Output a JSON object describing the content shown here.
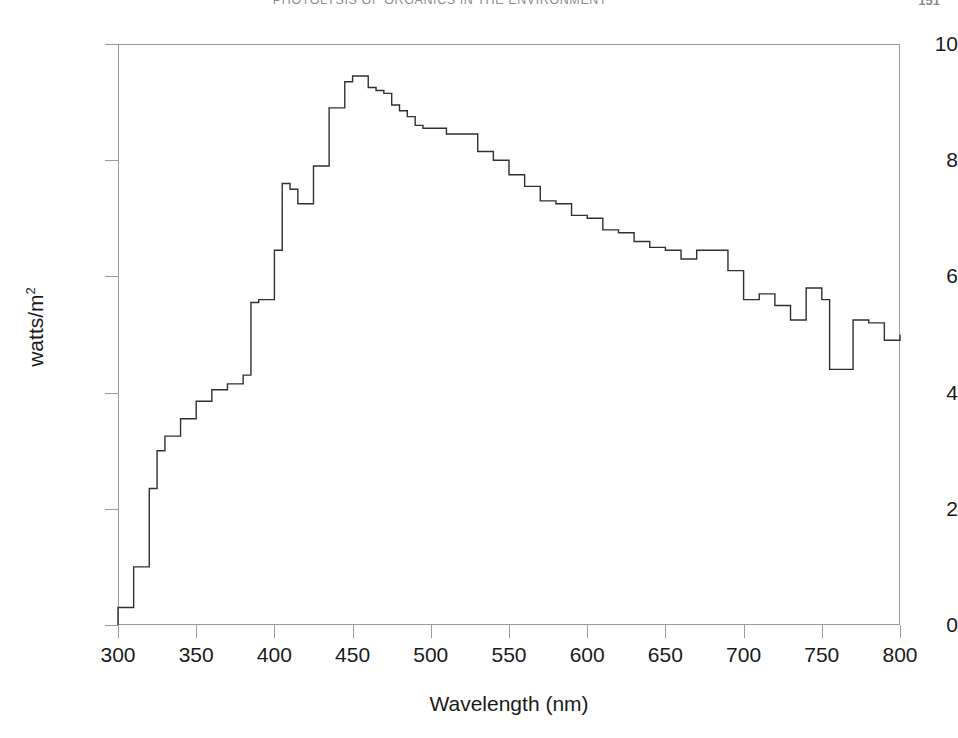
{
  "page": {
    "running_head": "PHOTOLYSIS OF ORGANICS IN THE ENVIRONMENT",
    "folio": "151"
  },
  "chart_data": {
    "type": "area",
    "render_style": "step",
    "title": "",
    "subtitle": "",
    "xlabel": "Wavelength (nm)",
    "ylabel": "watts/m2",
    "ylabel_base": "watts/m",
    "ylabel_exponent": "2",
    "xlim": [
      300,
      800
    ],
    "ylim": [
      0,
      10
    ],
    "xticks": [
      300,
      350,
      400,
      450,
      500,
      550,
      600,
      650,
      700,
      750,
      800
    ],
    "yticks": [
      0,
      2,
      4,
      6,
      8,
      10
    ],
    "xtick_labels": [
      "300",
      "350",
      "400",
      "450",
      "500",
      "550",
      "600",
      "650",
      "700",
      "750",
      "800"
    ],
    "ytick_labels": [
      "0",
      "2",
      "4",
      "6",
      "8",
      "10"
    ],
    "grid": false,
    "legend": "none",
    "line_color": "#303030",
    "line_width": 1.4,
    "bin_width_nm": 10,
    "x": [
      300,
      310,
      320,
      325,
      330,
      340,
      350,
      360,
      370,
      380,
      385,
      390,
      400,
      405,
      410,
      415,
      420,
      425,
      430,
      435,
      440,
      445,
      450,
      455,
      460,
      465,
      470,
      475,
      480,
      485,
      490,
      495,
      500,
      510,
      520,
      530,
      540,
      550,
      560,
      570,
      580,
      590,
      600,
      610,
      620,
      630,
      640,
      650,
      660,
      670,
      680,
      690,
      700,
      710,
      720,
      730,
      740,
      750,
      755,
      765,
      770,
      780,
      790,
      800
    ],
    "values": [
      0.3,
      1.0,
      2.35,
      3.0,
      3.25,
      3.55,
      3.85,
      4.05,
      4.15,
      4.3,
      5.55,
      5.6,
      6.45,
      7.6,
      7.5,
      7.25,
      7.25,
      7.9,
      7.9,
      8.9,
      8.9,
      9.35,
      9.45,
      9.45,
      9.25,
      9.2,
      9.15,
      8.95,
      8.85,
      8.75,
      8.6,
      8.55,
      8.55,
      8.45,
      8.45,
      8.15,
      8.0,
      7.75,
      7.55,
      7.3,
      7.25,
      7.05,
      7.0,
      6.8,
      6.75,
      6.6,
      6.5,
      6.45,
      6.3,
      6.45,
      6.45,
      6.1,
      5.6,
      5.7,
      5.5,
      5.25,
      5.8,
      5.6,
      4.4,
      4.4,
      5.25,
      5.2,
      4.9,
      5.0
    ],
    "series_name": "Solar spectral irradiance at sea level",
    "annotations": []
  }
}
